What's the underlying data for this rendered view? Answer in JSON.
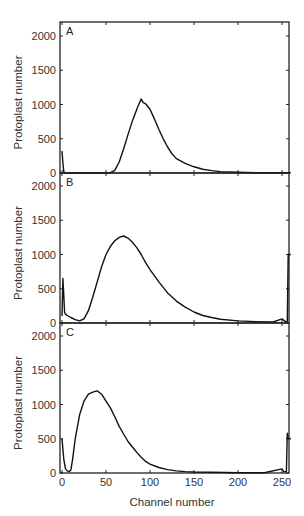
{
  "figure": {
    "xlabel": "Channel number",
    "ylabel": "Protoplast number",
    "x_ticks": [
      0,
      50,
      100,
      150,
      200,
      250
    ],
    "y_ticks": [
      0,
      500,
      1000,
      1500,
      2000
    ],
    "colors": {
      "line": "#111111",
      "axis": "#222222",
      "text": "#333333",
      "background": "#ffffff"
    }
  },
  "chart_data": [
    {
      "type": "line",
      "panel": "A",
      "title": "A",
      "xlabel": "",
      "ylabel": "Protoplast number",
      "xlim": [
        0,
        260
      ],
      "ylim": [
        0,
        2200
      ],
      "grid": false,
      "x": [
        0,
        1,
        2,
        3,
        5,
        10,
        20,
        30,
        40,
        50,
        55,
        60,
        65,
        70,
        75,
        80,
        85,
        88,
        90,
        92,
        95,
        100,
        105,
        110,
        115,
        120,
        125,
        130,
        140,
        150,
        160,
        170,
        180,
        200,
        220,
        250,
        260
      ],
      "values": [
        320,
        150,
        20,
        5,
        0,
        0,
        0,
        0,
        0,
        0,
        5,
        40,
        160,
        350,
        560,
        760,
        930,
        1020,
        1080,
        1030,
        1010,
        930,
        790,
        640,
        500,
        380,
        280,
        210,
        140,
        90,
        55,
        35,
        20,
        10,
        5,
        5,
        5
      ]
    },
    {
      "type": "line",
      "panel": "B",
      "title": "B",
      "xlabel": "",
      "ylabel": "Protoplast number",
      "xlim": [
        0,
        260
      ],
      "ylim": [
        0,
        2200
      ],
      "grid": false,
      "x": [
        0,
        1,
        2,
        3,
        4,
        6,
        10,
        15,
        20,
        25,
        30,
        35,
        40,
        45,
        50,
        55,
        60,
        65,
        70,
        75,
        80,
        85,
        90,
        95,
        100,
        110,
        120,
        130,
        140,
        150,
        160,
        170,
        180,
        200,
        220,
        240,
        250,
        254,
        256,
        257,
        258,
        260
      ],
      "values": [
        100,
        650,
        400,
        150,
        130,
        110,
        80,
        50,
        30,
        60,
        180,
        380,
        600,
        820,
        1000,
        1120,
        1200,
        1250,
        1270,
        1240,
        1180,
        1100,
        1000,
        880,
        780,
        600,
        440,
        320,
        230,
        160,
        110,
        80,
        55,
        30,
        20,
        15,
        60,
        20,
        20,
        1000,
        1000,
        1000
      ]
    },
    {
      "type": "line",
      "panel": "C",
      "title": "C",
      "xlabel": "Channel number",
      "ylabel": "Protoplast number",
      "xlim": [
        0,
        260
      ],
      "ylim": [
        0,
        2200
      ],
      "grid": false,
      "x": [
        0,
        1,
        2,
        4,
        6,
        8,
        10,
        12,
        15,
        20,
        25,
        30,
        35,
        40,
        45,
        50,
        55,
        60,
        65,
        70,
        75,
        80,
        85,
        90,
        95,
        100,
        110,
        120,
        130,
        140,
        150,
        170,
        200,
        230,
        250,
        252,
        255,
        256,
        257,
        258,
        260
      ],
      "values": [
        500,
        350,
        200,
        60,
        30,
        20,
        40,
        200,
        500,
        850,
        1050,
        1150,
        1180,
        1200,
        1150,
        1050,
        950,
        820,
        680,
        570,
        460,
        380,
        300,
        230,
        170,
        130,
        80,
        50,
        30,
        20,
        15,
        10,
        5,
        5,
        60,
        20,
        20,
        580,
        500,
        500,
        500
      ]
    }
  ]
}
